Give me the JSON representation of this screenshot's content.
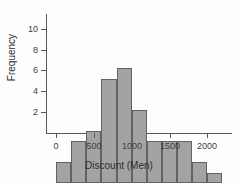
{
  "chart_data": {
    "type": "bar",
    "title": "",
    "subtitle": "",
    "xlabel": "Discount (Men)",
    "ylabel": "Frequency",
    "grid": false,
    "legend": false,
    "bin_width": 200,
    "bin_edges": [
      0,
      200,
      400,
      600,
      800,
      1000,
      1200,
      1400,
      1600,
      1800,
      2000,
      2200
    ],
    "categories": [
      "0-200",
      "200-400",
      "400-600",
      "600-800",
      "800-1000",
      "1000-1200",
      "1200-1400",
      "1400-1600",
      "1600-1800",
      "1800-2000",
      "2000-2200"
    ],
    "x": [
      100,
      300,
      500,
      700,
      900,
      1100,
      1300,
      1500,
      1700,
      1900,
      2100
    ],
    "values": [
      2,
      4,
      5,
      10,
      11,
      7,
      4,
      4,
      4,
      2,
      1
    ],
    "xlim": [
      -120,
      2300
    ],
    "ylim": [
      0,
      11.6
    ],
    "xticks": [
      0,
      500,
      1000,
      1500,
      2000
    ],
    "xtick_labels": [
      "0",
      "500",
      "1000",
      "1500",
      "2000"
    ],
    "yticks": [
      2,
      4,
      6,
      8,
      10
    ],
    "ytick_labels": [
      "2",
      "4",
      "6",
      "8",
      "10"
    ],
    "bar_fill_color": "#a3a3a3",
    "bar_edge_color": "#636365",
    "axis_color": "#59595b",
    "background_color": "#fdfdfd"
  }
}
